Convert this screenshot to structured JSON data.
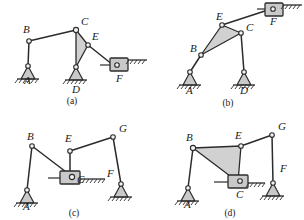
{
  "figure": {
    "background_color": "#ffffff",
    "line_color": "#2b2b2b",
    "fill_color": "#c9c9c9",
    "panel_count": 4
  },
  "panels": [
    {
      "id": "a",
      "caption": "(a)",
      "joint_labels": [
        "A",
        "B",
        "C",
        "D",
        "E",
        "F"
      ],
      "labels": {
        "A": "A",
        "B": "B",
        "C": "C",
        "D": "D",
        "E": "E",
        "F": "F"
      },
      "label_positions": {
        "A": [
          24,
          84
        ],
        "B": [
          27,
          31
        ],
        "C": [
          82,
          24
        ],
        "D": [
          76,
          86
        ],
        "E": [
          92,
          38
        ],
        "F": [
          119,
          81
        ]
      },
      "joints": {
        "A": [
          28,
          66
        ],
        "B": [
          29,
          41
        ],
        "C": [
          76,
          30
        ],
        "D": [
          76,
          67
        ],
        "E": [
          88,
          45
        ],
        "F": [
          113,
          65
        ]
      },
      "ternary_fill": [
        [
          76,
          30
        ],
        [
          76,
          67
        ],
        [
          88,
          45
        ]
      ],
      "links": [
        [
          "A",
          "B"
        ],
        [
          "B",
          "C"
        ],
        [
          "C",
          "E"
        ],
        [
          "E",
          "F"
        ]
      ],
      "ground_supports": [
        "A",
        "D"
      ],
      "slider": {
        "joint": "F",
        "orientation": "horizontal"
      },
      "caption_position": [
        72,
        103
      ]
    },
    {
      "id": "b",
      "caption": "(b)",
      "joint_labels": [
        "A",
        "B",
        "C",
        "D",
        "E",
        "F"
      ],
      "labels": {
        "A": "A",
        "B": "B",
        "C": "C",
        "D": "D",
        "E": "E",
        "F": "F"
      },
      "label_positions": {
        "A": [
          33,
          90
        ],
        "B": [
          39,
          51
        ],
        "C": [
          95,
          41
        ],
        "D": [
          88,
          90
        ],
        "E": [
          66,
          19
        ],
        "F": [
          117,
          19
        ]
      },
      "joints": {
        "A": [
          38,
          72
        ],
        "B": [
          49,
          55
        ],
        "C": [
          89,
          33
        ],
        "D": [
          92,
          72
        ],
        "E": [
          70,
          25
        ],
        "F": [
          119,
          8
        ]
      },
      "ternary_fill": [
        [
          70,
          25
        ],
        [
          49,
          55
        ],
        [
          89,
          33
        ]
      ],
      "links": [
        [
          "A",
          "B"
        ],
        [
          "C",
          "D"
        ],
        [
          "E",
          "F"
        ]
      ],
      "ground_supports": [
        "A",
        "D"
      ],
      "slider": {
        "joint": "F",
        "orientation": "horizontal"
      },
      "caption_position": [
        76,
        105
      ]
    },
    {
      "id": "c",
      "caption": "(c)",
      "joint_labels": [
        "A",
        "B",
        "C",
        "E",
        "F",
        "G"
      ],
      "labels": {
        "A": "A",
        "B": "B",
        "C": "C",
        "E": "E",
        "F": "F",
        "G": "G"
      },
      "label_positions": {
        "A": [
          22,
          107
        ],
        "B": [
          28,
          30
        ],
        "C": [
          79,
          79
        ],
        "E": [
          68,
          34
        ],
        "F": [
          109,
          73
        ],
        "G": [
          122,
          22
        ]
      },
      "joints": {
        "A": [
          27,
          87
        ],
        "B": [
          32,
          40
        ],
        "C": [
          74,
          76
        ],
        "E": [
          70,
          45
        ],
        "F": [
          121,
          86
        ],
        "G": [
          115,
          29
        ]
      },
      "links": [
        [
          "A",
          "B"
        ],
        [
          "B",
          "C"
        ],
        [
          "E",
          "C"
        ],
        [
          "E",
          "G"
        ],
        [
          "G",
          "F"
        ]
      ],
      "ground_supports": [
        "A",
        "F"
      ],
      "slider": {
        "joint": "C",
        "orientation": "horizontal"
      },
      "caption_position": [
        74,
        105
      ]
    },
    {
      "id": "d",
      "caption": "(d)",
      "joint_labels": [
        "A",
        "B",
        "C",
        "E",
        "F",
        "G"
      ],
      "labels": {
        "A": "A",
        "B": "B",
        "C": "C",
        "E": "E",
        "F": "F",
        "G": "G"
      },
      "label_positions": {
        "A": [
          32,
          106
        ],
        "B": [
          36,
          29
        ],
        "C": [
          91,
          88
        ],
        "E": [
          86,
          27
        ],
        "F": [
          133,
          62
        ],
        "G": [
          128,
          19
        ]
      },
      "joints": {
        "A": [
          36,
          85
        ],
        "B": [
          41,
          40
        ],
        "C": [
          88,
          74
        ],
        "E": [
          89,
          38
        ],
        "F": [
          120,
          75
        ],
        "G": [
          120,
          27
        ]
      },
      "ternary_fill": [
        [
          41,
          40
        ],
        [
          89,
          38
        ],
        [
          88,
          74
        ]
      ],
      "links": [
        [
          "A",
          "B"
        ],
        [
          "E",
          "G"
        ],
        [
          "G",
          "F"
        ]
      ],
      "ground_supports": [
        "A",
        "F"
      ],
      "slider": {
        "joint": "C",
        "orientation": "horizontal"
      },
      "caption_position": [
        78,
        105
      ]
    }
  ]
}
